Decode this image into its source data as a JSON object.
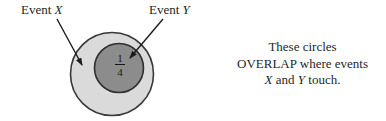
{
  "diagram": {
    "label_x": {
      "prefix": "Event ",
      "symbol": "X"
    },
    "label_y": {
      "prefix": "Event ",
      "symbol": "Y"
    },
    "fraction": {
      "numerator": "1",
      "denominator": "4"
    },
    "colors": {
      "outer_circle_fill": "#dadada",
      "outer_circle_stroke": "#383838",
      "inner_circle_fill": "#8c8c8c",
      "inner_circle_stroke": "#2e2e2e",
      "arrow": "#1c1c1c"
    }
  },
  "caption": {
    "line1": "These circles",
    "line2": "OVERLAP where events",
    "line3": {
      "sym1": "X",
      "mid": " and ",
      "sym2": "Y",
      "end": " touch."
    }
  }
}
